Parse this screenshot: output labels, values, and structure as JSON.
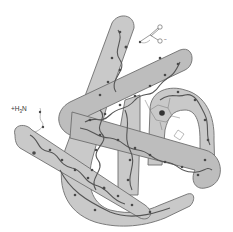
{
  "diagram": {
    "type": "protein-tertiary-structure",
    "labels": {
      "n_terminus": {
        "prefix": "+",
        "text": "H",
        "sub": "3",
        "suffix": "N"
      },
      "c_terminus": {
        "carbon": "C",
        "oxygen_double": "O",
        "oxygen_single": "O",
        "charge": "−"
      }
    },
    "colors": {
      "tube_fill": "#c9c9c9",
      "tube_fill_dark": "#b2b2b2",
      "tube_stroke": "#6e6e6e",
      "backbone": "#555555",
      "atom": "#4a4a4a",
      "heme": "#3a3a3a",
      "background": "#ffffff"
    },
    "segments": [
      {
        "id": "helix-A",
        "role": "front-left diagonal helix"
      },
      {
        "id": "helix-B",
        "role": "long vertical back helix"
      },
      {
        "id": "helix-C",
        "role": "upper diagonal helix"
      },
      {
        "id": "helix-D",
        "role": "middle diagonal helix"
      },
      {
        "id": "helix-E",
        "role": "right loop helix around heme"
      },
      {
        "id": "helix-F",
        "role": "bottom u-turn"
      }
    ],
    "heme": {
      "label": "heme-group"
    }
  }
}
